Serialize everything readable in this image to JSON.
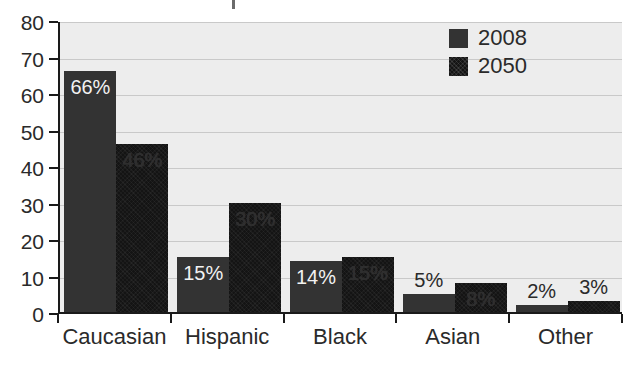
{
  "chart_data": {
    "type": "bar",
    "title": "",
    "xlabel": "",
    "ylabel": "",
    "categories": [
      "Caucasian",
      "Hispanic",
      "Black",
      "Asian",
      "Other"
    ],
    "series": [
      {
        "name": "2008",
        "color": "#333333",
        "values": [
          66,
          15,
          14,
          5,
          2
        ],
        "labels": [
          "66%",
          "15%",
          "14%",
          "5%",
          "2%"
        ],
        "label_positions": [
          "inside",
          "inside",
          "inside",
          "above",
          "above"
        ]
      },
      {
        "name": "2050",
        "color": "#141414",
        "values": [
          46,
          30,
          15,
          8,
          3
        ],
        "labels": [
          "46%",
          "30%",
          "15%",
          "8%",
          "3%"
        ],
        "label_positions": [
          "inside",
          "inside",
          "inside",
          "inside",
          "above"
        ]
      }
    ],
    "ylim": [
      0,
      80
    ],
    "yticks": [
      0,
      10,
      20,
      30,
      40,
      50,
      60,
      70,
      80
    ],
    "ytick_labels": [
      "0",
      "10",
      "20",
      "30",
      "40",
      "50",
      "60",
      "70",
      "80"
    ],
    "grid": true,
    "legend_position": "top-right",
    "plot_background": "#ededed",
    "axis_color": "#1a1a1a",
    "gridline_color": "#c9c9c9"
  },
  "legend": {
    "entries": [
      {
        "label": "2008"
      },
      {
        "label": "2050"
      }
    ]
  }
}
